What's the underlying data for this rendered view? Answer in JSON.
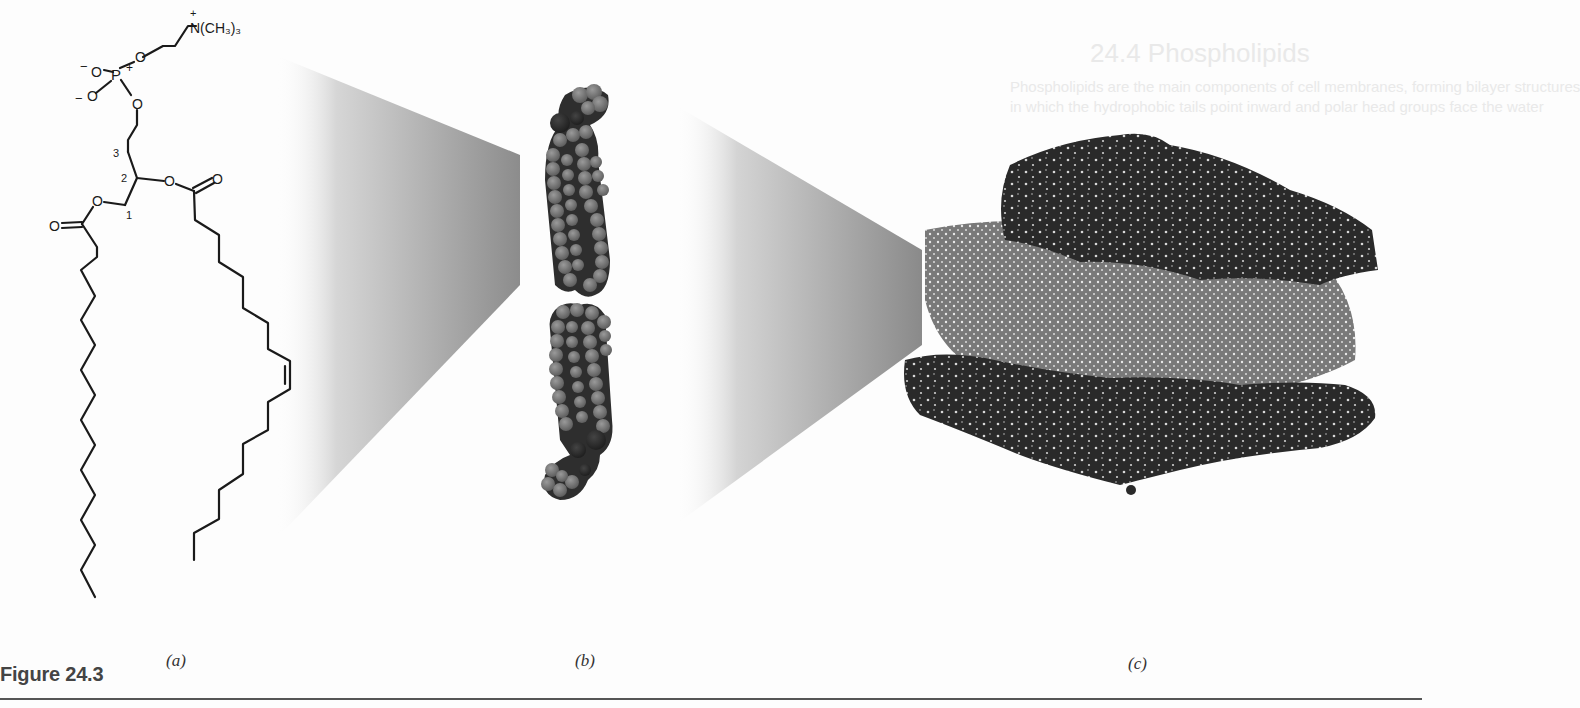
{
  "figure": {
    "caption": "Figure 24.3",
    "panels": [
      {
        "id": "a",
        "label": "(a)",
        "description": "Structural formula of a phosphatidylcholine (phospholipid)"
      },
      {
        "id": "b",
        "label": "(b)",
        "description": "Space-filling model of phospholipid molecules"
      },
      {
        "id": "c",
        "label": "(c)",
        "description": "Space-filling model of a lipid bilayer"
      }
    ]
  },
  "structure": {
    "headgroup_label": "N(CH₃)₃",
    "headgroup_charge": "+",
    "phosphorus": "P",
    "phosphorus_charge": "+",
    "oxygen": "O",
    "negative_charge": "−",
    "glycerol_carbons": [
      "1",
      "2",
      "3"
    ]
  },
  "bleed_through": {
    "title": "24.4 Phospholipids",
    "line1": "Phospholipids are the main components of cell membranes, forming bilayer structures",
    "line2": "in which the hydrophobic tails point inward and polar head groups face the water"
  },
  "colors": {
    "background": "#fdfdfd",
    "ink": "#1a1a1a",
    "wedge_dark": "#8a8a8a",
    "atom_light": "#7a7a7a",
    "atom_dark": "#2e2e2e",
    "caption": "#444444"
  }
}
